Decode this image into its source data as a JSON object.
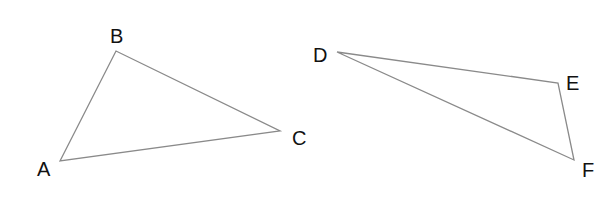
{
  "diagram": {
    "title": "",
    "triangles": [
      {
        "name": "ABC",
        "vertices": [
          {
            "label": "A",
            "x": 60,
            "y": 161,
            "lx": 37,
            "ly": 176
          },
          {
            "label": "B",
            "x": 116,
            "y": 51,
            "lx": 110,
            "ly": 43
          },
          {
            "label": "C",
            "x": 280,
            "y": 131,
            "lx": 292,
            "ly": 145
          }
        ]
      },
      {
        "name": "DEF",
        "vertices": [
          {
            "label": "D",
            "x": 337,
            "y": 52,
            "lx": 313,
            "ly": 62
          },
          {
            "label": "E",
            "x": 558,
            "y": 83,
            "lx": 566,
            "ly": 90
          },
          {
            "label": "F",
            "x": 574,
            "y": 160,
            "lx": 582,
            "ly": 177
          }
        ]
      }
    ],
    "colors": {
      "edge": "#8a8a8a",
      "label": "#111111",
      "background": "#ffffff"
    }
  }
}
